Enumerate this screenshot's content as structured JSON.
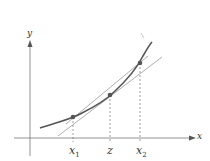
{
  "diagram": {
    "axes": {
      "x_label": "x",
      "y_label": "y"
    },
    "points": [
      {
        "id": "x1",
        "label": "x",
        "subscript": "1"
      },
      {
        "id": "z",
        "label": "z",
        "subscript": ""
      },
      {
        "id": "x2",
        "label": "x",
        "subscript": "2"
      }
    ],
    "colors": {
      "curve": "#555555",
      "lines": "#888888",
      "points": "#555555",
      "axes": "#777777"
    }
  }
}
